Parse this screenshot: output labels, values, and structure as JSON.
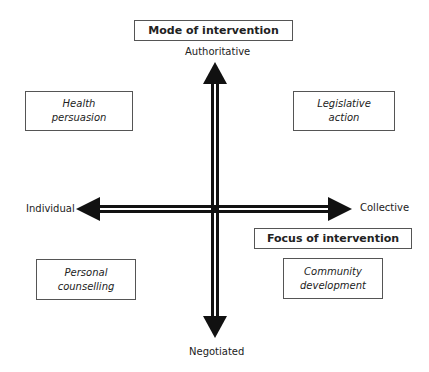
{
  "diagram": {
    "mode_title": "Mode of intervention",
    "focus_title": "Focus of intervention",
    "axes": {
      "vertical": {
        "top": "Authoritative",
        "bottom": "Negotiated"
      },
      "horizontal": {
        "left": "Individual",
        "right": "Collective"
      }
    },
    "quadrants": {
      "top_left": {
        "line1": "Health",
        "line2": "persuasion"
      },
      "top_right": {
        "line1": "Legislative",
        "line2": "action"
      },
      "bottom_left": {
        "line1": "Personal",
        "line2": "counselling"
      },
      "bottom_right": {
        "line1": "Community",
        "line2": "development"
      }
    },
    "colors": {
      "arrow": "#111111",
      "border": "#555555",
      "background": "#ffffff"
    }
  }
}
